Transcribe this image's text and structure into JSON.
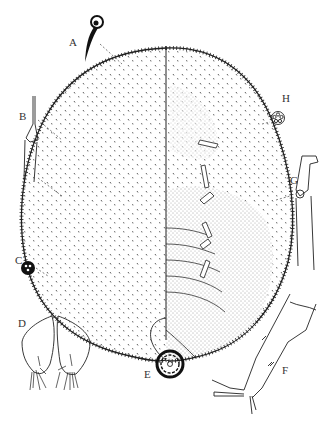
{
  "figure": {
    "type": "morphology plate",
    "ink_color": "#222222",
    "background": "#ffffff",
    "labels": [
      {
        "id": "A",
        "text": "A",
        "x": 69,
        "y": 44,
        "part": "dorsal seta"
      },
      {
        "id": "B",
        "text": "B",
        "x": 19,
        "y": 118,
        "part": "marginal seta"
      },
      {
        "id": "C",
        "text": "C",
        "x": 15,
        "y": 262,
        "part": "trilocular pore"
      },
      {
        "id": "D",
        "text": "D",
        "x": 18,
        "y": 325,
        "part": "anal lobes"
      },
      {
        "id": "E",
        "text": "E",
        "x": 144,
        "y": 376,
        "part": "multilocular disc pore"
      },
      {
        "id": "F",
        "text": "F",
        "x": 282,
        "y": 372,
        "part": "hind leg"
      },
      {
        "id": "G",
        "text": "G",
        "x": 290,
        "y": 182,
        "part": "tubular duct"
      },
      {
        "id": "H",
        "text": "H",
        "x": 282,
        "y": 100,
        "part": "quinquelocular pore"
      }
    ]
  }
}
